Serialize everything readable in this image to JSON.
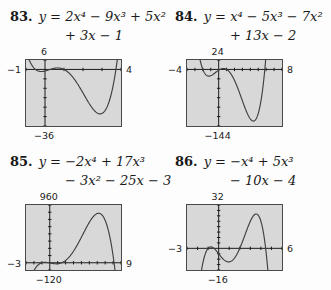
{
  "colors": {
    "page_background": "#fdfdfd",
    "plot_background": "#d8d8d8",
    "plot_border": "#4a4a4a",
    "axis": "#1c1c1c",
    "curve": "#3f3f3f",
    "text": "#1a1a1a"
  },
  "problems": [
    {
      "number": "83.",
      "equation_line1": "y = 2x⁴ − 9x³ + 5x²",
      "equation_line2": "+ 3x − 1",
      "window_labels": {
        "top": "6",
        "bottom": "−36",
        "left": "−1",
        "right": "4"
      }
    },
    {
      "number": "84.",
      "equation_line1": "y = x⁴ − 5x³ − 7x²",
      "equation_line2": "+ 13x − 2",
      "window_labels": {
        "top": "24",
        "bottom": "−144",
        "left": "−4",
        "right": "8"
      }
    },
    {
      "number": "85.",
      "equation_line1": "y = −2x⁴ + 17x³",
      "equation_line2": "− 3x² − 25x − 3",
      "window_labels": {
        "top": "960",
        "bottom": "−120",
        "left": "−3",
        "right": "9"
      }
    },
    {
      "number": "86.",
      "equation_line1": "y = −x⁴ + 5x³",
      "equation_line2": "− 10x − 4",
      "window_labels": {
        "top": "32",
        "bottom": "−16",
        "left": "−3",
        "right": "6"
      }
    }
  ],
  "chart_data": [
    {
      "type": "line",
      "title": "Problem 83 calculator graph",
      "equation": "y = 2x⁴ − 9x³ + 5x² + 3x − 1",
      "polynomial_coefficients": [
        2,
        -9,
        5,
        3,
        -1
      ],
      "window": {
        "xmin": -1,
        "xmax": 4,
        "xscl": 1,
        "ymin": -36,
        "ymax": 6,
        "yscl": 6
      }
    },
    {
      "type": "line",
      "title": "Problem 84 calculator graph",
      "equation": "y = x⁴ − 5x³ − 7x² + 13x − 2",
      "polynomial_coefficients": [
        1,
        -5,
        -7,
        13,
        -2
      ],
      "window": {
        "xmin": -4,
        "xmax": 8,
        "xscl": 1,
        "ymin": -144,
        "ymax": 24,
        "yscl": 24
      }
    },
    {
      "type": "line",
      "title": "Problem 85 calculator graph",
      "equation": "y = −2x⁴ + 17x³ − 3x² − 25x − 3",
      "polynomial_coefficients": [
        -2,
        17,
        -3,
        -25,
        -3
      ],
      "window": {
        "xmin": -3,
        "xmax": 9,
        "xscl": 1,
        "ymin": -120,
        "ymax": 960,
        "yscl": 120
      }
    },
    {
      "type": "line",
      "title": "Problem 86 calculator graph",
      "equation": "y = −x⁴ + 5x³ − 10x − 4",
      "polynomial_coefficients": [
        -1,
        5,
        0,
        -10,
        -4
      ],
      "window": {
        "xmin": -3,
        "xmax": 6,
        "xscl": 1,
        "ymin": -16,
        "ymax": 32,
        "yscl": 4
      }
    }
  ]
}
